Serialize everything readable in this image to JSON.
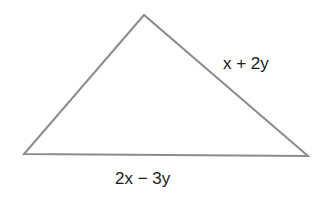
{
  "diagram": {
    "type": "triangle",
    "stroke_color": "#8c8c8c",
    "vertices": {
      "apex": [
        144,
        15
      ],
      "left": [
        24,
        154
      ],
      "right": [
        308,
        156
      ]
    },
    "labels": {
      "right_side": "x + 2y",
      "base": "2x − 3y"
    }
  }
}
